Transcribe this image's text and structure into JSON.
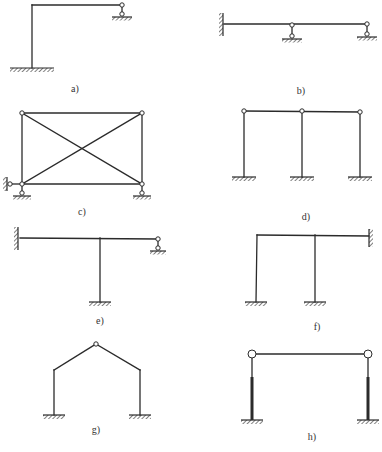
{
  "figure": {
    "background": "#ffffff",
    "line_color": "#2b2b2b",
    "panels": [
      {
        "id": "a",
        "label": "a)",
        "label_pos": [
          75,
          92
        ],
        "description": "L-shaped frame: fixed base column, horizontal beam ending in pin with roller support",
        "members": [
          [
            32,
            68,
            32,
            5
          ],
          [
            32,
            5,
            122,
            5
          ]
        ],
        "thick_members": [],
        "pins": [
          [
            122,
            5
          ],
          [
            122,
            14
          ]
        ],
        "links": [
          [
            122,
            5,
            122,
            14
          ]
        ],
        "fixed_ground": [
          [
            32,
            68,
            22
          ]
        ],
        "hinge_ground": [
          [
            122,
            17,
            10
          ]
        ],
        "walls": []
      },
      {
        "id": "b",
        "label": "b)",
        "label_pos": [
          301,
          94
        ],
        "description": "Continuous beam: fixed wall left, two link-roller supports",
        "members": [
          [
            224,
            24,
            367,
            24
          ]
        ],
        "thick_members": [],
        "pins": [
          [
            292,
            25
          ],
          [
            292,
            36
          ],
          [
            367,
            24
          ],
          [
            367,
            34
          ]
        ],
        "links": [
          [
            292,
            25,
            292,
            36
          ],
          [
            367,
            24,
            367,
            34
          ]
        ],
        "fixed_ground": [],
        "hinge_ground": [
          [
            292,
            39,
            10
          ],
          [
            367,
            37,
            10
          ]
        ],
        "walls": [
          [
            223,
            13,
            36,
            "left"
          ]
        ]
      },
      {
        "id": "c",
        "label": "c)",
        "label_pos": [
          82,
          215
        ],
        "description": "Rectangular truss with cross bracing, pinned joints, link supports",
        "members": [
          [
            22,
            113,
            142,
            113
          ],
          [
            22,
            113,
            22,
            184
          ],
          [
            142,
            113,
            142,
            184
          ],
          [
            22,
            184,
            142,
            184
          ],
          [
            22,
            113,
            142,
            184
          ],
          [
            22,
            184,
            142,
            113
          ]
        ],
        "thick_members": [],
        "pins": [
          [
            22,
            113
          ],
          [
            142,
            113
          ],
          [
            22,
            184
          ],
          [
            142,
            184
          ],
          [
            10,
            184
          ],
          [
            22,
            193
          ],
          [
            142,
            193
          ]
        ],
        "links": [
          [
            10,
            184,
            22,
            184
          ],
          [
            22,
            184,
            22,
            193
          ],
          [
            142,
            184,
            142,
            193
          ]
        ],
        "fixed_ground": [],
        "hinge_ground": [
          [
            22,
            196,
            9
          ],
          [
            142,
            196,
            9
          ]
        ],
        "walls": [
          [
            7,
            177,
            191,
            "left"
          ]
        ]
      },
      {
        "id": "d",
        "label": "d)",
        "label_pos": [
          306,
          220
        ],
        "description": "Two-bay portal frame: three fixed-base columns pinned to beams",
        "members": [
          [
            244,
            111,
            360,
            112
          ],
          [
            244,
            111,
            244,
            177
          ],
          [
            302,
            111,
            302,
            177
          ],
          [
            360,
            112,
            360,
            177
          ]
        ],
        "thick_members": [],
        "pins": [
          [
            244,
            111
          ],
          [
            302,
            111
          ],
          [
            360,
            112
          ]
        ],
        "links": [],
        "fixed_ground": [
          [
            244,
            177,
            12
          ],
          [
            302,
            177,
            12
          ],
          [
            360,
            177,
            12
          ]
        ],
        "hinge_ground": [],
        "walls": []
      },
      {
        "id": "e",
        "label": "e)",
        "label_pos": [
          100,
          324
        ],
        "description": "T-frame: fixed wall at left, fixed-base column, right end on link roller",
        "members": [
          [
            20,
            238,
            158,
            239
          ],
          [
            100,
            238,
            100,
            302
          ]
        ],
        "thick_members": [],
        "pins": [
          [
            158,
            239
          ],
          [
            158,
            248
          ]
        ],
        "links": [
          [
            158,
            239,
            158,
            248
          ]
        ],
        "fixed_ground": [
          [
            100,
            302,
            11
          ]
        ],
        "hinge_ground": [
          [
            158,
            251,
            8
          ]
        ],
        "walls": [
          [
            18,
            227,
            250,
            "left"
          ]
        ]
      },
      {
        "id": "f",
        "label": "f)",
        "label_pos": [
          317,
          330
        ],
        "description": "Frame with two fixed-base columns and beam fixed into right wall",
        "members": [
          [
            257,
            235,
            369,
            236
          ],
          [
            257,
            235,
            256,
            302
          ],
          [
            315,
            235,
            315,
            302
          ]
        ],
        "thick_members": [],
        "pins": [],
        "links": [],
        "fixed_ground": [
          [
            256,
            302,
            11
          ],
          [
            315,
            302,
            11
          ]
        ],
        "hinge_ground": [],
        "walls": [
          [
            369,
            229,
            247,
            "right"
          ]
        ]
      },
      {
        "id": "g",
        "label": "g)",
        "label_pos": [
          96,
          433
        ],
        "description": "Three-hinged gable frame with fixed column bases",
        "members": [
          [
            54,
            415,
            54,
            370
          ],
          [
            54,
            370,
            96,
            344
          ],
          [
            96,
            344,
            140,
            370
          ],
          [
            140,
            370,
            140,
            415
          ]
        ],
        "thick_members": [],
        "pins": [
          [
            96,
            344
          ]
        ],
        "links": [],
        "fixed_ground": [
          [
            54,
            415,
            11
          ],
          [
            140,
            415,
            11
          ]
        ],
        "hinge_ground": [],
        "walls": []
      },
      {
        "id": "h",
        "label": "h)",
        "label_pos": [
          312,
          440
        ],
        "description": "Portal with pinned beam ends; columns stiffened (thick) in lower part, fixed bases",
        "members": [
          [
            255,
            354,
            365,
            354
          ],
          [
            252,
            357,
            252,
            377
          ],
          [
            368,
            357,
            368,
            377
          ]
        ],
        "thick_members": [
          [
            252,
            377,
            252,
            420
          ],
          [
            368,
            377,
            368,
            420
          ]
        ],
        "pins": [
          [
            252,
            354
          ],
          [
            368,
            354
          ]
        ],
        "pin_radius_large": 4,
        "links": [],
        "fixed_ground": [
          [
            252,
            420,
            11
          ],
          [
            368,
            420,
            11
          ]
        ],
        "hinge_ground": [],
        "walls": []
      }
    ]
  }
}
